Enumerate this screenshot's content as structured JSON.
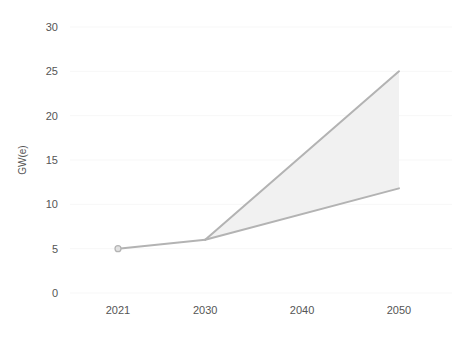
{
  "chart_data": {
    "type": "line",
    "title": "",
    "subtitle": "",
    "xlabel": "",
    "ylabel": "GW(e)",
    "x": [
      2021,
      2030,
      2040,
      2050
    ],
    "xlim": [
      2021,
      2050
    ],
    "ylim": [
      0,
      30
    ],
    "xticks": [
      "2021",
      "2030",
      "2040",
      "2050"
    ],
    "xtick_values": [
      2021,
      2030,
      2040,
      2050
    ],
    "yticks": [
      "0",
      "5",
      "10",
      "15",
      "20",
      "25",
      "30"
    ],
    "ytick_values": [
      0,
      5,
      10,
      15,
      20,
      25,
      30
    ],
    "grid": true,
    "grid_axis": "y",
    "legend": "none",
    "series": [
      {
        "name": "historical",
        "x": [
          2021,
          2030
        ],
        "values": [
          5.0,
          6.0
        ],
        "markers": [
          {
            "x": 2021,
            "y": 5.0
          }
        ]
      },
      {
        "name": "projection-high",
        "x": [
          2030,
          2050
        ],
        "values": [
          6.0,
          25.0
        ]
      },
      {
        "name": "projection-low",
        "x": [
          2030,
          2050
        ],
        "values": [
          6.0,
          11.8
        ]
      }
    ],
    "band": {
      "name": "projection-range",
      "x": [
        2030,
        2050
      ],
      "upper": [
        6.0,
        25.0
      ],
      "lower": [
        6.0,
        11.8
      ]
    },
    "colors": {
      "line": "#b3b3b3",
      "band_fill": "#f1f1f1",
      "gridline": "#f7f7f7",
      "text": "#555555",
      "marker_fill": "#e2e2e2",
      "marker_stroke": "#b3b3b3",
      "background": "#ffffff"
    }
  }
}
